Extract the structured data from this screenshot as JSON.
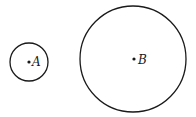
{
  "diagram": {
    "circles": [
      {
        "label": "A",
        "cx": 29,
        "cy": 62,
        "r": 19
      },
      {
        "label": "B",
        "cx": 133,
        "cy": 59,
        "r": 53
      }
    ],
    "stroke_color": "#1a1a1a",
    "background": "#ffffff"
  }
}
